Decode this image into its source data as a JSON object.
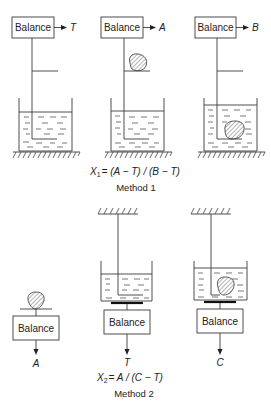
{
  "method1": {
    "title": "Method 1",
    "formula": {
      "lhs_var": "X",
      "lhs_sub": "1",
      "rhs": "= (A − T) / (B − T)"
    },
    "panels": [
      {
        "balance_label": "Balance",
        "output": "T",
        "sample": "none",
        "sample_location": "none"
      },
      {
        "balance_label": "Balance",
        "output": "A",
        "sample": "solid",
        "sample_location": "on-shelf-in-air"
      },
      {
        "balance_label": "Balance",
        "output": "B",
        "sample": "solid",
        "sample_location": "immersed-in-liquid"
      }
    ]
  },
  "method2": {
    "title": "Method 2",
    "formula": {
      "lhs_var": "X",
      "lhs_sub": "2",
      "rhs": "= A / (C − T)"
    },
    "panels": [
      {
        "balance_label": "Balance",
        "output": "A",
        "sample": "solid",
        "sample_location": "on-balance-in-air"
      },
      {
        "balance_label": "Balance",
        "output": "T",
        "sample": "none",
        "sample_location": "beaker-on-balance-with-suspended-holder"
      },
      {
        "balance_label": "Balance",
        "output": "C",
        "sample": "solid",
        "sample_location": "suspended-in-liquid-on-balance"
      }
    ]
  },
  "colors": {
    "line": "#3a3a3a",
    "background": "#ffffff"
  }
}
